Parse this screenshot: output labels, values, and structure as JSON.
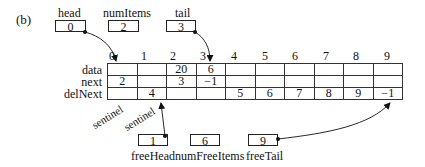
{
  "figure_label": "(b)",
  "top_boxes": [
    {
      "name": "head",
      "value": "0"
    },
    {
      "name": "numItems",
      "value": "2"
    },
    {
      "name": "tail",
      "value": "3"
    }
  ],
  "bottom_boxes": [
    {
      "name": "freeHead",
      "value": "1"
    },
    {
      "name": "numFreeItems",
      "value": "6"
    },
    {
      "name": "freeTail",
      "value": "9"
    }
  ],
  "array": {
    "indices": [
      "0",
      "1",
      "2",
      "3",
      "4",
      "5",
      "6",
      "7",
      "8",
      "9"
    ],
    "rows": [
      {
        "label": "data",
        "cells": [
          "",
          "",
          "20",
          "6",
          "",
          "",
          "",
          "",
          "",
          ""
        ]
      },
      {
        "label": "next",
        "cells": [
          "2",
          "",
          "3",
          "−1",
          "",
          "",
          "",
          "",
          "",
          ""
        ]
      },
      {
        "label": "delNext",
        "cells": [
          "",
          "4",
          "",
          "",
          "5",
          "6",
          "7",
          "8",
          "9",
          "−1"
        ]
      }
    ]
  },
  "annotations": [
    "sentinel",
    "sentinel"
  ],
  "arrows": [
    {
      "from": "head",
      "to": "index-0"
    },
    {
      "from": "tail",
      "to": "index-3"
    },
    {
      "from": "freeHead",
      "to": "delNext-1"
    },
    {
      "from": "freeTail",
      "to": "delNext-9"
    }
  ]
}
